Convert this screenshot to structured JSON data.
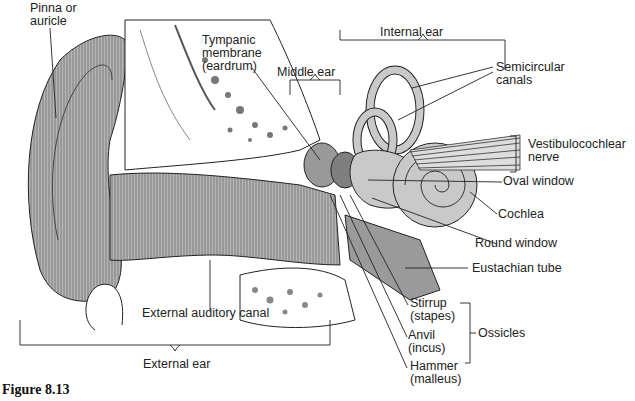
{
  "figure": {
    "caption": "Figure 8.13"
  },
  "labels": {
    "pinna": {
      "line1": "Pinna or",
      "line2": "auricle"
    },
    "tympanic": {
      "line1": "Tympanic",
      "line2": "membrane",
      "line3": "(eardrum)"
    },
    "middle_ear": "Middle ear",
    "internal_ear": "Internal ear",
    "semicircular": {
      "line1": "Semicircular",
      "line2": "canals"
    },
    "vestibulocochlear": {
      "line1": "Vestibulocochlear",
      "line2": "nerve"
    },
    "oval_window": "Oval window",
    "cochlea": "Cochlea",
    "round_window": "Round window",
    "eustachian": "Eustachian tube",
    "stirrup": {
      "line1": "Stirrup",
      "line2": "(stapes)"
    },
    "anvil": {
      "line1": "Anvil",
      "line2": "(incus)"
    },
    "hammer": {
      "line1": "Hammer",
      "line2": "(malleus)"
    },
    "ossicles": "Ossicles",
    "external_canal": "External auditory canal",
    "external_ear": "External ear"
  },
  "colors": {
    "tissue": "#b8b8b8",
    "tissue_dark": "#8c8c8c",
    "bone": "#ffffff",
    "line": "#222222",
    "inner_ear": "#c9c9c9"
  }
}
